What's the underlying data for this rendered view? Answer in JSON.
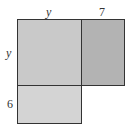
{
  "diagram": {
    "type": "area-model",
    "labels": {
      "top": [
        "y",
        "7"
      ],
      "left": [
        "y",
        "6"
      ]
    },
    "regions": [
      {
        "name": "y-by-y",
        "row": "y",
        "col": "y",
        "color": "#c9c9c9"
      },
      {
        "name": "y-by-7",
        "row": "y",
        "col": "7",
        "color": "#b3b3b3"
      },
      {
        "name": "6-by-y",
        "row": "6",
        "col": "y",
        "color": "#d4d4d4"
      }
    ],
    "border_color": "#333333"
  }
}
